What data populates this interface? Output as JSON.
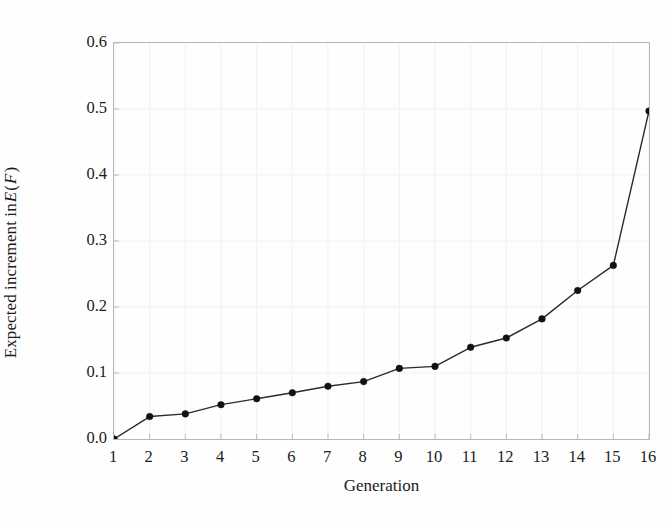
{
  "chart_data": {
    "type": "line",
    "title": "",
    "xlabel": "Generation",
    "ylabel_parts": {
      "pre": "Expected increment in ",
      "var1": "E",
      "mid": " (",
      "var2": "F",
      "post": ")"
    },
    "ylabel": "Expected increment in E (F)",
    "x": [
      1,
      2,
      3,
      4,
      5,
      6,
      7,
      8,
      9,
      10,
      11,
      12,
      13,
      14,
      15,
      16
    ],
    "values": [
      0.0,
      0.034,
      0.038,
      0.052,
      0.061,
      0.07,
      0.08,
      0.087,
      0.107,
      0.11,
      0.139,
      0.153,
      0.182,
      0.225,
      0.263,
      0.497
    ],
    "xtick_labels": [
      "1",
      "2",
      "3",
      "4",
      "5",
      "6",
      "7",
      "8",
      "9",
      "10",
      "11",
      "12",
      "13",
      "14",
      "15",
      "16"
    ],
    "ytick_labels": [
      "0.0",
      "0.1",
      "0.2",
      "0.3",
      "0.4",
      "0.5",
      "0.6"
    ],
    "ytick_values": [
      0.0,
      0.1,
      0.2,
      0.3,
      0.4,
      0.5,
      0.6
    ],
    "xlim": [
      1,
      16
    ],
    "ylim": [
      0.0,
      0.6
    ],
    "grid": true,
    "legend": null,
    "marker": "filled-circle",
    "line_color": "#2a2a2a",
    "marker_color": "#111111",
    "grid_color": "#f1f1f1",
    "axis_color": "#b8b8b8",
    "background": "#fefefe"
  }
}
